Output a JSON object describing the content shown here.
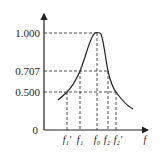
{
  "y_ticks": [
    {
      "label": "1.000",
      "v": 1.0
    },
    {
      "label": "0.707",
      "v": 0.707
    },
    {
      "label": "0.500",
      "v": 0.5
    }
  ],
  "origin_label": "0",
  "x_axis_label": "f",
  "x_marks": [
    {
      "label": "f₁'",
      "key": "f1p"
    },
    {
      "label": "f₁",
      "key": "f1"
    },
    {
      "label": "f₀",
      "key": "f0"
    },
    {
      "label": "f₂",
      "key": "f2"
    },
    {
      "label": "f₂'",
      "key": "f2p"
    }
  ],
  "colors": {
    "line": "#222222"
  }
}
